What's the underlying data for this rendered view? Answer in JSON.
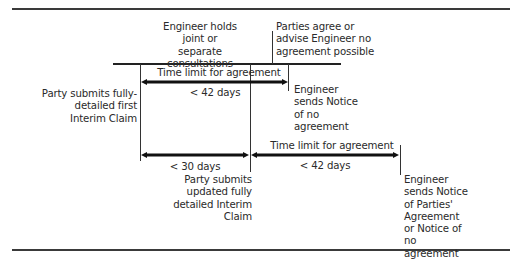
{
  "diagram": {
    "top_event": {
      "engineer_consultations": "Engineer holds joint or separate consultations",
      "parties_agree": "Parties agree or advise Engineer no agreement possible"
    },
    "first_phase": {
      "arrow_label_top": "Time limit for agreement",
      "arrow_label_bottom": "< 42 days",
      "start_event": "Party submits fully-detailed first Interim Claim",
      "end_event": "Engineer sends Notice of no agreement"
    },
    "second_phase": {
      "submission_arrow_label": "< 30 days",
      "submission_event": "Party submits updated fully detailed Interim Claim",
      "arrow_label_top": "Time limit for agreement",
      "arrow_label_bottom": "< 42 days",
      "end_event": "Engineer sends Notice of Parties' Agreement or Notice of no agreement"
    }
  }
}
